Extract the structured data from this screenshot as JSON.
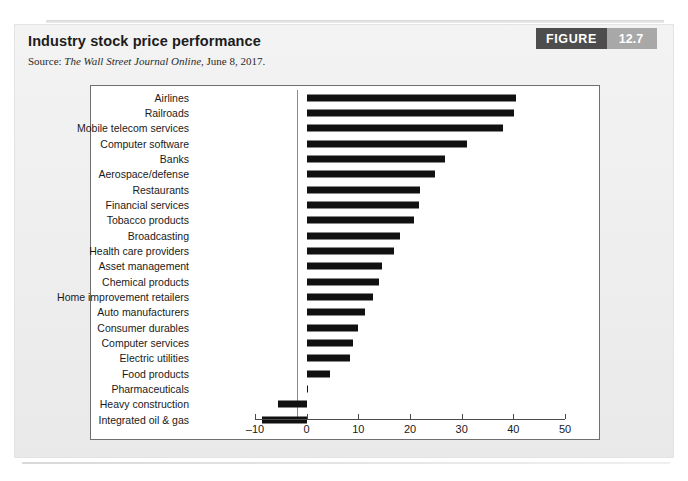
{
  "figure": {
    "title": "Industry stock price performance",
    "source_label": "Source:",
    "source_publication": "The Wall Street Journal Online",
    "source_date": ", June 8, 2017.",
    "badge_word": "FIGURE",
    "badge_number": "12.7"
  },
  "colors": {
    "bar": "#111111",
    "badge_word_bg": "#4d4d4d",
    "badge_num_bg": "#a8a8a8",
    "card_bg": "#eeeeee",
    "panel_bg": "#ffffff",
    "axis": "#4a4a4a"
  },
  "chart_data": {
    "type": "bar",
    "orientation": "horizontal",
    "title": "Industry stock price performance",
    "xlabel": "",
    "ylabel": "",
    "xlim": [
      -10,
      50
    ],
    "xticks": [
      -10,
      0,
      10,
      20,
      30,
      40,
      50
    ],
    "xticklabels": [
      "–10",
      "0",
      "10",
      "20",
      "30",
      "40",
      "50"
    ],
    "grid": false,
    "legend": null,
    "zero_reference_line": true,
    "categories": [
      "Airlines",
      "Railroads",
      "Mobile telecom services",
      "Computer software",
      "Banks",
      "Aerospace/defense",
      "Restaurants",
      "Financial services",
      "Tobacco products",
      "Broadcasting",
      "Health care providers",
      "Asset management",
      "Chemical products",
      "Home improvement retailers",
      "Auto manufacturers",
      "Consumer durables",
      "Computer services",
      "Electric utilities",
      "Food products",
      "Pharmaceuticals",
      "Heavy construction",
      "Integrated oil & gas"
    ],
    "values": [
      40.5,
      40.2,
      38.0,
      31.0,
      26.8,
      24.8,
      22.0,
      21.8,
      20.8,
      18.0,
      17.0,
      14.5,
      14.0,
      12.8,
      11.2,
      10.0,
      9.0,
      8.4,
      4.6,
      0.3,
      -5.5,
      -8.6
    ]
  }
}
